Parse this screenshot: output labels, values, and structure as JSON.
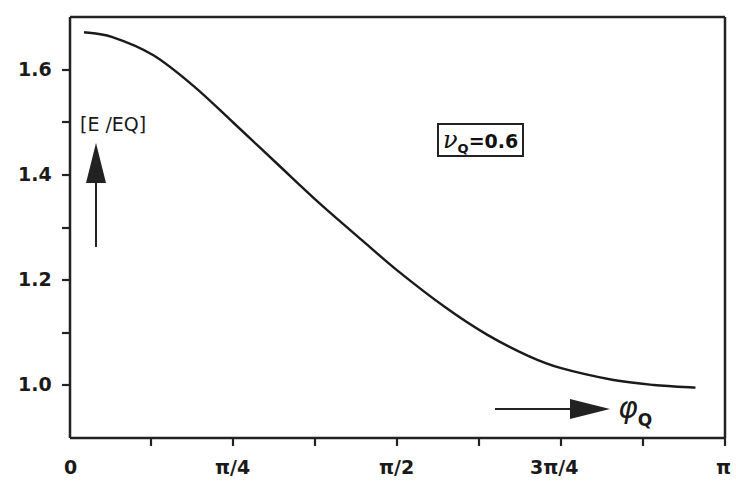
{
  "chart_data": {
    "type": "line",
    "title": "",
    "xlabel": "φQ",
    "ylabel": "[E /EQ]",
    "annotation": "νQ=0.6",
    "x_ticks": [
      "0",
      "π/4",
      "π/2",
      "3π/4",
      "π"
    ],
    "y_ticks": [
      "1.0",
      "1.2",
      "1.4",
      "1.6"
    ],
    "xlim": [
      0,
      3.1416
    ],
    "ylim": [
      0.9,
      1.7
    ],
    "grid": false,
    "legend": "none",
    "series": [
      {
        "name": "E/EQ (νQ=0.6)",
        "x": [
          0.067,
          0.2,
          0.4,
          0.6,
          0.785,
          1.0,
          1.2,
          1.4,
          1.571,
          1.8,
          2.0,
          2.2,
          2.356,
          2.6,
          2.8,
          3.0
        ],
        "values": [
          1.672,
          1.663,
          1.628,
          1.567,
          1.499,
          1.419,
          1.345,
          1.276,
          1.218,
          1.148,
          1.096,
          1.055,
          1.032,
          1.01,
          1.0,
          0.995
        ]
      }
    ]
  },
  "labels": {
    "y_tick_16": "1.6",
    "y_tick_14": "1.4",
    "y_tick_12": "1.2",
    "y_tick_10": "1.0",
    "x_tick_0": "0",
    "x_tick_pi4": "π/4",
    "x_tick_pi2": "π/2",
    "x_tick_3pi4": "3π/4",
    "x_tick_pi": "π",
    "y_axis_label": "[E /EQ]",
    "x_axis_symbol": "φ",
    "x_axis_sub": "Q",
    "annotation_symbol": "ν",
    "annotation_sub": "Q",
    "annotation_value": "=0.6"
  }
}
